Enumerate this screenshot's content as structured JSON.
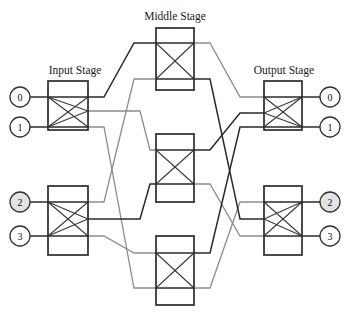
{
  "figure": {
    "width": 347,
    "height": 313,
    "background": "#ffffff"
  },
  "colors": {
    "box_stroke": "#2b2b2b",
    "link_dark": "#2a2a2a",
    "link_gray": "#8d8d8d",
    "circle_stroke": "#333333",
    "circle_fill_highlight": "#e3e3e3",
    "circle_fill_plain": "#ffffff",
    "text": "#1a1a1a"
  },
  "stages": {
    "input": {
      "title": "Input Stage",
      "title_x": 75,
      "title_y": 74,
      "switch_count": 2,
      "switches": [
        {
          "id": "in-0",
          "x": 48,
          "y": 81,
          "w": 40,
          "h": 49,
          "in_ports": [
            97,
            127
          ],
          "out_ports": [
            97,
            111,
            127
          ]
        },
        {
          "id": "in-1",
          "x": 48,
          "y": 186,
          "w": 40,
          "h": 69,
          "in_ports": [
            202,
            236
          ],
          "out_ports": [
            202,
            219,
            236
          ]
        }
      ]
    },
    "middle": {
      "title": "Middle Stage",
      "title_x": 175,
      "title_y": 20,
      "switch_count": 3,
      "switches": [
        {
          "id": "mid-0",
          "x": 156,
          "y": 28,
          "w": 38,
          "h": 62,
          "in_ports": [
            43,
            79
          ],
          "out_ports": [
            43,
            79
          ]
        },
        {
          "id": "mid-1",
          "x": 156,
          "y": 134,
          "w": 38,
          "h": 68,
          "in_ports": [
            150,
            184
          ],
          "out_ports": [
            150,
            184
          ]
        },
        {
          "id": "mid-2",
          "x": 156,
          "y": 236,
          "w": 38,
          "h": 69,
          "in_ports": [
            253,
            288
          ],
          "out_ports": [
            253,
            288
          ]
        }
      ]
    },
    "output": {
      "title": "Output Stage",
      "title_x": 284,
      "title_y": 74,
      "switch_count": 2,
      "switches": [
        {
          "id": "out-0",
          "x": 264,
          "y": 81,
          "w": 38,
          "h": 49,
          "in_ports": [
            97,
            113,
            127
          ],
          "out_ports": [
            97,
            127
          ]
        },
        {
          "id": "out-1",
          "x": 264,
          "y": 186,
          "w": 38,
          "h": 69,
          "in_ports": [
            202,
            219,
            236
          ],
          "out_ports": [
            202,
            236
          ]
        }
      ]
    }
  },
  "terminals": {
    "left": [
      {
        "label": "0",
        "cx": 20,
        "cy": 97,
        "r": 10,
        "highlight": false
      },
      {
        "label": "1",
        "cx": 20,
        "cy": 127,
        "r": 10,
        "highlight": false
      },
      {
        "label": "2",
        "cx": 20,
        "cy": 202,
        "r": 10,
        "highlight": true
      },
      {
        "label": "3",
        "cx": 20,
        "cy": 236,
        "r": 10,
        "highlight": false
      }
    ],
    "right": [
      {
        "label": "0",
        "cx": 330,
        "cy": 97,
        "r": 10,
        "highlight": false
      },
      {
        "label": "1",
        "cx": 330,
        "cy": 127,
        "r": 10,
        "highlight": false
      },
      {
        "label": "2",
        "cx": 330,
        "cy": 202,
        "r": 10,
        "highlight": true
      },
      {
        "label": "3",
        "cx": 330,
        "cy": 236,
        "r": 10,
        "highlight": false
      }
    ]
  },
  "terminal_stubs": [
    {
      "name": "stub-left-0",
      "from_x": 30,
      "from_y": 97,
      "to_x": 48,
      "to_y": 97
    },
    {
      "name": "stub-left-1",
      "from_x": 30,
      "from_y": 127,
      "to_x": 48,
      "to_y": 127
    },
    {
      "name": "stub-left-2",
      "from_x": 30,
      "from_y": 202,
      "to_x": 48,
      "to_y": 202
    },
    {
      "name": "stub-left-3",
      "from_x": 30,
      "from_y": 236,
      "to_x": 48,
      "to_y": 236
    },
    {
      "name": "stub-right-0",
      "from_x": 302,
      "from_y": 97,
      "to_x": 320,
      "to_y": 97
    },
    {
      "name": "stub-right-1",
      "from_x": 302,
      "from_y": 127,
      "to_x": 320,
      "to_y": 127
    },
    {
      "name": "stub-right-2",
      "from_x": 302,
      "from_y": 202,
      "to_x": 320,
      "to_y": 202
    },
    {
      "name": "stub-right-3",
      "from_x": 302,
      "from_y": 236,
      "to_x": 320,
      "to_y": 236
    }
  ],
  "links": [
    {
      "name": "link-in0-mid0",
      "weight": "dark",
      "points": "88,97 104,97 134,43 156,43"
    },
    {
      "name": "link-in0-mid1",
      "weight": "gray",
      "points": "88,111 140,111 150,150 156,150"
    },
    {
      "name": "link-in0-mid2",
      "weight": "gray",
      "points": "88,127 104,127 134,288 156,288"
    },
    {
      "name": "link-in1-mid0",
      "weight": "gray",
      "points": "88,202 104,202 134,79 156,79"
    },
    {
      "name": "link-in1-mid1",
      "weight": "dark",
      "points": "88,219 140,219 150,184 156,184"
    },
    {
      "name": "link-in1-mid2",
      "weight": "gray",
      "points": "88,236 104,236 134,253 156,253"
    },
    {
      "name": "link-mid0-out0",
      "weight": "gray",
      "points": "194,43 210,43 240,97 264,97"
    },
    {
      "name": "link-mid0-out1",
      "weight": "dark",
      "points": "194,79 210,79 240,219 264,219"
    },
    {
      "name": "link-mid1-out0",
      "weight": "dark",
      "points": "194,150 210,150 240,113 264,113"
    },
    {
      "name": "link-mid1-out1",
      "weight": "gray",
      "points": "194,184 210,184 240,236 264,236"
    },
    {
      "name": "link-mid2-out0",
      "weight": "dark",
      "points": "194,253 210,253 240,127 264,127"
    },
    {
      "name": "link-mid2-out1",
      "weight": "gray",
      "points": "194,288 210,288 240,202 264,202"
    }
  ],
  "input_fanouts": [
    {
      "name": "fan-in0",
      "segments": [
        "48,97 88,111",
        "48,97 88,127",
        "48,127 88,97",
        "48,127 88,111"
      ]
    },
    {
      "name": "fan-in1",
      "segments": [
        "48,202 88,219",
        "48,202 88,236",
        "48,236 88,202",
        "48,236 88,219"
      ]
    }
  ],
  "output_fanins": [
    {
      "name": "fan-out0",
      "segments": [
        "264,97 302,127",
        "264,113 302,97",
        "264,113 302,127",
        "264,127 302,97"
      ]
    },
    {
      "name": "fan-out1",
      "segments": [
        "264,202 302,236",
        "264,219 302,202",
        "264,219 302,236",
        "264,236 302,202"
      ]
    }
  ]
}
